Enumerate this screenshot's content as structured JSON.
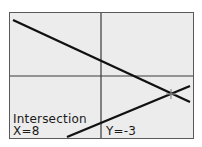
{
  "calculator_screen": {
    "mode": "graph",
    "axes": {
      "color": "#3a3a3a"
    },
    "graphs": [
      {
        "name": "descending-line",
        "color": "#111111"
      },
      {
        "name": "ascending-line",
        "color": "#111111"
      }
    ],
    "cursor": {
      "type": "crosshair",
      "at": "intersection"
    },
    "readout": {
      "label": "Intersection",
      "x_text": "X=8",
      "y_text": "Y=-3",
      "x_value": 8,
      "y_value": -3
    },
    "background_color": "#ececec"
  }
}
